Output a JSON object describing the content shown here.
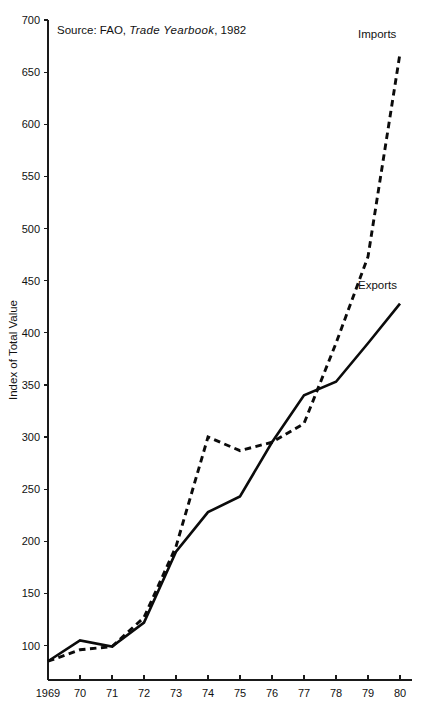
{
  "source_note": {
    "prefix": "Source: FAO,",
    "publication": "Trade Yearbook",
    "suffix": ", 1982"
  },
  "chart_data": {
    "type": "line",
    "title": "",
    "subtitle": "",
    "xlabel": "",
    "ylabel": "Index of Total Value",
    "x": [
      1969,
      1970,
      1971,
      1972,
      1973,
      1974,
      1975,
      1976,
      1977,
      1978,
      1979,
      1980
    ],
    "categories": [
      "1969",
      "70",
      "71",
      "72",
      "73",
      "74",
      "75",
      "76",
      "77",
      "78",
      "79",
      "80"
    ],
    "xtick_labels": [
      "1969",
      "70",
      "71",
      "72",
      "73",
      "74",
      "75",
      "76",
      "77",
      "78",
      "79",
      "80"
    ],
    "ytick_labels": [
      "100",
      "150",
      "200",
      "250",
      "300",
      "350",
      "400",
      "450",
      "500",
      "550",
      "600",
      "650",
      "700"
    ],
    "ytick_values": [
      100,
      150,
      200,
      250,
      300,
      350,
      400,
      450,
      500,
      550,
      600,
      650,
      700
    ],
    "ylim": [
      67,
      700
    ],
    "xlim": [
      1969,
      1980
    ],
    "grid": false,
    "legend_position": "inline-end-of-line",
    "series": [
      {
        "name": "Imports",
        "style": "dashed",
        "color": "#0b0b0b",
        "label": "Imports",
        "values": [
          85,
          96,
          99,
          127,
          195,
          300,
          287,
          295,
          313,
          390,
          473,
          668
        ]
      },
      {
        "name": "Exports",
        "style": "solid",
        "color": "#0b0b0b",
        "label": "Exports",
        "values": [
          85,
          105,
          99,
          122,
          190,
          228,
          243,
          295,
          340,
          353,
          390,
          428
        ]
      }
    ],
    "annotations": [
      "Source: FAO, Trade Yearbook, 1982"
    ]
  }
}
